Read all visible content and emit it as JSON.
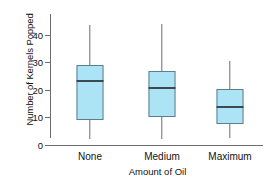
{
  "chart_data": {
    "type": "boxplot",
    "title": "",
    "xlabel": "Amount of Oil",
    "ylabel": "Number of Kernels Popped",
    "categories": [
      "None",
      "Medium",
      "Maximum"
    ],
    "ylim": [
      0,
      45
    ],
    "yticks": [
      0,
      10,
      20,
      30,
      40
    ],
    "ytick_labels": [
      "0",
      "10",
      "20",
      "30",
      "40"
    ],
    "grid": false,
    "legend": null,
    "series": [
      {
        "name": "None",
        "min": 2,
        "q1": 9,
        "median": 23.5,
        "q3": 29,
        "max": 43.5
      },
      {
        "name": "Medium",
        "min": 2,
        "q1": 10,
        "median": 21,
        "q3": 27,
        "max": 44
      },
      {
        "name": "Maximum",
        "min": 2.5,
        "q1": 7.5,
        "median": 14,
        "q3": 20.5,
        "max": 30.5
      }
    ],
    "colors": {
      "box_fill": "#ade4f5",
      "box_stroke": "#5c7f8c",
      "median": "#3b4a52",
      "whisker": "#6e6e6e",
      "axis": "#6d6d6d",
      "text": "#111111",
      "background": "#ffffff"
    }
  },
  "axes": {
    "y_title": "Number of Kernels Popped",
    "x_title": "Amount of Oil",
    "y_tick_0": "0",
    "y_tick_1": "10",
    "y_tick_2": "20",
    "y_tick_3": "30",
    "y_tick_4": "40",
    "cat_0": "None",
    "cat_1": "Medium",
    "cat_2": "Maximum"
  }
}
